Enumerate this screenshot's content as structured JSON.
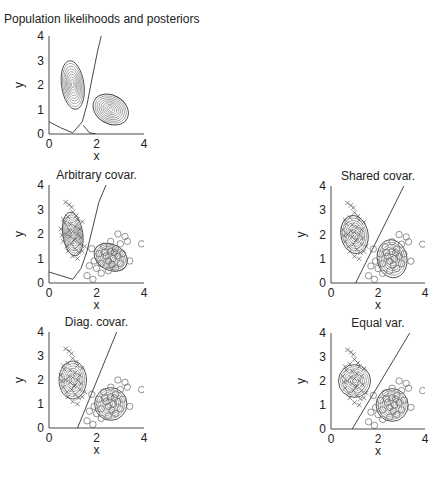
{
  "figure": {
    "title": "Population likelihoods and posteriors"
  },
  "chart_data": [
    {
      "type": "contour",
      "id": "population",
      "title": "Population likelihoods and posteriors",
      "xlabel": "x",
      "ylabel": "y",
      "xlim": [
        0,
        4
      ],
      "ylim": [
        0,
        4
      ],
      "xticks": [
        0,
        2,
        4
      ],
      "yticks": [
        0,
        1,
        2,
        3,
        4
      ],
      "box": {
        "left": 49,
        "top": 36,
        "right": 144,
        "bottom": 134
      },
      "classes": [
        {
          "name": "class-x",
          "mean": [
            1.0,
            2.0
          ],
          "sd": [
            0.45,
            0.95
          ],
          "angle": -8,
          "levels": 9
        },
        {
          "name": "class-o",
          "mean": [
            2.6,
            1.0
          ],
          "sd": [
            0.75,
            0.55
          ],
          "angle": 30,
          "levels": 9
        }
      ],
      "boundary": [
        [
          0,
          0.5
        ],
        [
          0.5,
          0.25
        ],
        [
          1.0,
          0.05
        ],
        [
          1.4,
          0.5
        ],
        [
          1.6,
          1.2
        ],
        [
          1.8,
          2.2
        ],
        [
          2.05,
          3.4
        ],
        [
          2.2,
          4.0
        ]
      ],
      "boundary2": [
        [
          1.45,
          0.35
        ],
        [
          1.7,
          0.05
        ],
        [
          2.0,
          0.0
        ]
      ],
      "scatter": false
    },
    {
      "type": "contour+scatter",
      "id": "arbitrary",
      "title": "Arbitrary covar.",
      "xlabel": "x",
      "ylabel": "y",
      "xlim": [
        0,
        4
      ],
      "ylim": [
        0,
        4
      ],
      "xticks": [
        0,
        2,
        4
      ],
      "yticks": [
        0,
        1,
        2,
        3,
        4
      ],
      "box": {
        "left": 49,
        "top": 185,
        "right": 144,
        "bottom": 283
      },
      "classes": [
        {
          "name": "class-x",
          "mean": [
            1.0,
            2.0
          ],
          "sd": [
            0.4,
            0.85
          ],
          "angle": -8,
          "levels": 9
        },
        {
          "name": "class-o",
          "mean": [
            2.6,
            1.05
          ],
          "sd": [
            0.7,
            0.5
          ],
          "angle": 28,
          "levels": 9
        }
      ],
      "boundary": [
        [
          0,
          0.45
        ],
        [
          0.5,
          0.3
        ],
        [
          1.0,
          0.15
        ],
        [
          1.35,
          0.6
        ],
        [
          1.6,
          1.3
        ],
        [
          1.85,
          2.3
        ],
        [
          2.1,
          3.3
        ],
        [
          2.4,
          4.0
        ]
      ],
      "scatter": true
    },
    {
      "type": "contour+scatter",
      "id": "shared",
      "title": "Shared covar.",
      "xlabel": "x",
      "ylabel": "y",
      "xlim": [
        0,
        4
      ],
      "ylim": [
        0,
        4
      ],
      "xticks": [
        0,
        2,
        4
      ],
      "yticks": [
        0,
        1,
        2,
        3,
        4
      ],
      "box": {
        "left": 331,
        "top": 186,
        "right": 425,
        "bottom": 283
      },
      "classes": [
        {
          "name": "class-x",
          "mean": [
            1.0,
            2.0
          ],
          "sd": [
            0.55,
            0.75
          ],
          "angle": -10,
          "levels": 8
        },
        {
          "name": "class-o",
          "mean": [
            2.6,
            1.0
          ],
          "sd": [
            0.6,
            0.75
          ],
          "angle": -10,
          "levels": 8
        }
      ],
      "boundary": [
        [
          1.05,
          0.0
        ],
        [
          3.1,
          4.0
        ]
      ],
      "scatter": true
    },
    {
      "type": "contour+scatter",
      "id": "diagonal",
      "title": "Diag. covar.",
      "xlabel": "x",
      "ylabel": "y",
      "xlim": [
        0,
        4
      ],
      "ylim": [
        0,
        4
      ],
      "xticks": [
        0,
        2,
        4
      ],
      "yticks": [
        0,
        1,
        2,
        3,
        4
      ],
      "box": {
        "left": 49,
        "top": 332,
        "right": 144,
        "bottom": 428
      },
      "classes": [
        {
          "name": "class-x",
          "mean": [
            1.0,
            2.0
          ],
          "sd": [
            0.55,
            0.75
          ],
          "angle": 0,
          "levels": 8
        },
        {
          "name": "class-o",
          "mean": [
            2.6,
            1.0
          ],
          "sd": [
            0.65,
            0.65
          ],
          "angle": 0,
          "levels": 8
        }
      ],
      "boundary": [
        [
          1.2,
          0.0
        ],
        [
          2.85,
          4.0
        ]
      ],
      "scatter": true
    },
    {
      "type": "contour+scatter",
      "id": "equal",
      "title": "Equal var.",
      "xlabel": "x",
      "ylabel": "y",
      "xlim": [
        0,
        4
      ],
      "ylim": [
        0,
        4
      ],
      "xticks": [
        0,
        2,
        4
      ],
      "yticks": [
        0,
        1,
        2,
        3,
        4
      ],
      "box": {
        "left": 331,
        "top": 333,
        "right": 425,
        "bottom": 429
      },
      "classes": [
        {
          "name": "class-x",
          "mean": [
            1.0,
            2.0
          ],
          "sd": [
            0.65,
            0.65
          ],
          "angle": 0,
          "levels": 8
        },
        {
          "name": "class-o",
          "mean": [
            2.6,
            1.0
          ],
          "sd": [
            0.65,
            0.65
          ],
          "angle": 0,
          "levels": 8
        }
      ],
      "boundary": [
        [
          0.9,
          0.0
        ],
        [
          3.35,
          4.0
        ]
      ],
      "scatter": true
    }
  ],
  "samples": {
    "class_x_marker": "x",
    "class_o_marker": "o",
    "x_points": [
      [
        0.7,
        3.3
      ],
      [
        0.85,
        3.2
      ],
      [
        0.95,
        3.1
      ],
      [
        0.6,
        2.6
      ],
      [
        0.5,
        2.2
      ],
      [
        0.8,
        2.7
      ],
      [
        1.0,
        2.9
      ],
      [
        1.2,
        2.6
      ],
      [
        1.4,
        2.5
      ],
      [
        0.7,
        2.0
      ],
      [
        0.9,
        1.9
      ],
      [
        1.0,
        2.1
      ],
      [
        1.1,
        1.8
      ],
      [
        1.2,
        2.0
      ],
      [
        0.95,
        1.6
      ],
      [
        1.3,
        1.6
      ],
      [
        1.1,
        1.4
      ],
      [
        0.8,
        1.3
      ],
      [
        1.0,
        1.1
      ],
      [
        1.2,
        1.0
      ],
      [
        1.4,
        1.3
      ],
      [
        1.5,
        1.5
      ],
      [
        0.6,
        1.7
      ],
      [
        0.9,
        2.4
      ],
      [
        1.1,
        2.3
      ],
      [
        0.75,
        1.5
      ],
      [
        1.3,
        2.2
      ],
      [
        1.05,
        1.75
      ],
      [
        0.85,
        2.15
      ],
      [
        1.25,
        1.25
      ],
      [
        0.65,
        2.45
      ],
      [
        1.15,
        2.75
      ],
      [
        0.55,
        1.95
      ],
      [
        1.35,
        1.85
      ]
    ],
    "o_points": [
      [
        1.8,
        1.4
      ],
      [
        1.7,
        0.7
      ],
      [
        1.9,
        0.9
      ],
      [
        1.6,
        0.3
      ],
      [
        1.85,
        0.15
      ],
      [
        2.1,
        1.2
      ],
      [
        2.2,
        0.8
      ],
      [
        2.3,
        1.5
      ],
      [
        2.4,
        1.1
      ],
      [
        2.5,
        0.9
      ],
      [
        2.6,
        1.3
      ],
      [
        2.7,
        1.0
      ],
      [
        2.8,
        1.4
      ],
      [
        2.9,
        1.1
      ],
      [
        3.0,
        0.8
      ],
      [
        3.1,
        1.2
      ],
      [
        2.5,
        0.5
      ],
      [
        2.2,
        0.4
      ],
      [
        2.8,
        0.6
      ],
      [
        3.2,
        1.9
      ],
      [
        3.0,
        1.6
      ],
      [
        2.9,
        2.0
      ],
      [
        3.3,
        1.7
      ],
      [
        3.9,
        1.6
      ],
      [
        3.4,
        0.9
      ],
      [
        2.6,
        1.7
      ],
      [
        2.0,
        0.6
      ],
      [
        2.35,
        1.25
      ],
      [
        2.65,
        0.75
      ],
      [
        2.75,
        1.25
      ]
    ]
  }
}
